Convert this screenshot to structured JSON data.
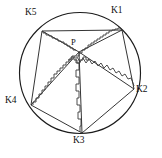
{
  "figure": {
    "type": "geometric-diagram",
    "canvas": {
      "width": 162,
      "height": 158
    },
    "background_color": "#ffffff",
    "stroke_color": "#1b1b1b",
    "circle": {
      "cx": 80,
      "cy": 73,
      "r": 60.5
    },
    "center_point": {
      "name": "P",
      "label": "P",
      "x": 79,
      "y": 52,
      "label_x": 71,
      "label_y": 38
    },
    "vertices": [
      {
        "name": "K1",
        "label": "K1",
        "x": 122,
        "y": 30,
        "label_x": 111,
        "label_y": 6,
        "angle_deg": -45
      },
      {
        "name": "K2",
        "label": "K2",
        "x": 134,
        "y": 89,
        "label_x": 136,
        "label_y": 85,
        "angle_deg": 15
      },
      {
        "name": "K3",
        "label": "K3",
        "x": 82,
        "y": 133,
        "label_x": 73,
        "label_y": 136,
        "angle_deg": 85
      },
      {
        "name": "K4",
        "label": "K4",
        "x": 31,
        "y": 105,
        "label_x": 5,
        "label_y": 96,
        "angle_deg": 150
      },
      {
        "name": "K5",
        "label": "K5",
        "x": 42,
        "y": 31,
        "label_x": 25,
        "label_y": 8,
        "angle_deg": -130
      }
    ],
    "spokes": [
      {
        "name": "spoke-P-K1",
        "from": "P",
        "to": "K1",
        "d": "M 79 52 L 122 30"
      },
      {
        "name": "spoke-P-K2",
        "from": "P",
        "to": "K2",
        "d": "M 79 52 L 134 89"
      },
      {
        "name": "spoke-P-K3",
        "from": "P",
        "to": "K3",
        "d": "M 79 52 L 82 133"
      },
      {
        "name": "spoke-P-K4",
        "from": "P",
        "to": "K4",
        "d": "M 79 52 L 31 105"
      },
      {
        "name": "spoke-P-K5",
        "from": "P",
        "to": "K5",
        "d": "M 79 52 L 42 31"
      },
      {
        "name": "chord-K1-K2",
        "from": "K1",
        "to": "K2",
        "d": "M 122 30 L 134 89"
      },
      {
        "name": "chord-K2-K3",
        "from": "K2",
        "to": "K3",
        "d": "M 134 89 L 82 133"
      },
      {
        "name": "chord-K3-K4",
        "from": "K3",
        "to": "K4",
        "d": "M 82 133 L 31 105"
      },
      {
        "name": "chord-K4-K5",
        "from": "K4",
        "to": "K5",
        "d": "M 31 105 L 42 31"
      },
      {
        "name": "chord-K5-K1",
        "from": "K5",
        "to": "K1",
        "d": "M 42 31 L 122 30"
      }
    ],
    "jagged_paths": [
      {
        "name": "jagged-P-K1",
        "along": "spoke-P-K1",
        "d": "M 76 56 L 79 56 L 79 53 L 82 53 L 82 50 L 85 50 L 85 48 L 88 48 L 88 45 L 91 45 L 91 43 L 94 43 L 94 41 L 97 41 L 97 39 L 100 39 L 100 37 L 103 37 L 103 35 L 106 35 L 106 33 L 109 33 L 109 31 L 112 31 L 112 30 L 115 30 L 115 29 L 118 29 L 118 28 L 121 28 L 121 29"
      },
      {
        "name": "jagged-P-K2",
        "along": "spoke-P-K2",
        "d": "M 77 57 L 80 62 L 83 58 L 86 63 L 89 59 L 92 64 L 95 61 L 98 66 L 101 63 L 104 68 L 107 65 L 110 70 L 113 68 L 116 73 L 119 71 L 122 76 L 125 74 L 128 79 L 131 78 L 133 83 L 134 86"
      },
      {
        "name": "jagged-P-K3",
        "along": "spoke-P-K3",
        "d": "M 76 57 L 76 63 L 79 63 L 79 70 L 76 70 L 76 77 L 79 77 L 79 84 L 76 84 L 76 91 L 79 91 L 79 98 L 77 98 L 77 105 L 80 105 L 80 112 L 78 112 L 78 119 L 81 119 L 81 126 L 80 126 L 80 132"
      },
      {
        "name": "jagged-P-K4",
        "along": "spoke-P-K4",
        "d": "M 75 56 L 72 56 L 72 59 L 69 59 L 69 62 L 66 62 L 66 65 L 63 65 L 63 68 L 60 68 L 60 71 L 57 71 L 57 74 L 54 74 L 54 78 L 51 78 L 51 82 L 48 82 L 48 86 L 45 86 L 45 90 L 42 90 L 42 94 L 39 94 L 39 98 L 36 98 L 36 102 L 33 102 L 33 105"
      },
      {
        "name": "jagged-P-K5",
        "along": "spoke-P-K5",
        "d": "M 76 50 L 73 50 L 73 48 L 70 48 L 70 46 L 67 46 L 67 44 L 64 44 L 64 42 L 61 42 L 61 41 L 58 41 L 58 39 L 55 39 L 55 38 L 52 38 L 52 36 L 49 36 L 49 35 L 46 35 L 46 33 L 43 33 L 43 32"
      },
      {
        "name": "jagged-center-cluster",
        "along": "center",
        "d": "M 68 60 L 71 60 L 71 57 L 74 57 L 74 60 L 77 60 L 77 63 L 80 63 L 80 60 L 83 60 L 83 57 L 86 57 L 86 60 L 89 60"
      }
    ]
  }
}
